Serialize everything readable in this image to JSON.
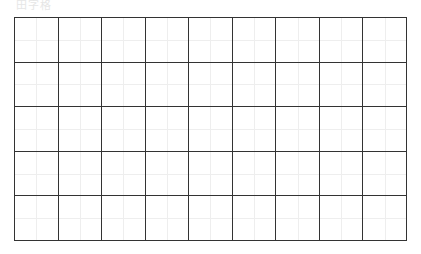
{
  "title": "田字格",
  "grid": {
    "rows": 5,
    "columns": 9,
    "line_color": "#333333",
    "guide_color": "#eeeeee"
  }
}
